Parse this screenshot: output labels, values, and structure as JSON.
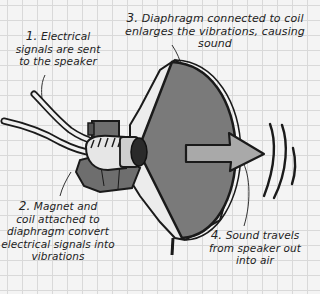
{
  "diagram": {
    "labels": [
      {
        "id": "l1",
        "number": "1.",
        "lines": [
          "Electrical",
          "signals are sent",
          "to the speaker"
        ]
      },
      {
        "id": "l2",
        "number": "2.",
        "lines": [
          "Magnet and",
          "coil attached to",
          "diaphragm convert",
          "electrical signals into",
          "vibrations"
        ]
      },
      {
        "id": "l3",
        "number": "3.",
        "lines": [
          "Diaphragm connected to coil",
          "enlarges the vibrations, causing sound"
        ]
      },
      {
        "id": "l4",
        "number": "4.",
        "lines": [
          "Sound travels",
          "from speaker out",
          "into air"
        ]
      }
    ],
    "parts": [
      "wires",
      "magnet",
      "coil",
      "diaphragm",
      "sound-arrow",
      "sound-waves"
    ],
    "colors": {
      "background": "#f4f4f4",
      "grid": "#d9d9d9",
      "diaphragm": "#7a7a7a",
      "arrow": "#a9a9a9",
      "magnet": "#707070",
      "coil": "#e6e6e6",
      "outline": "#1a1a1a"
    }
  }
}
